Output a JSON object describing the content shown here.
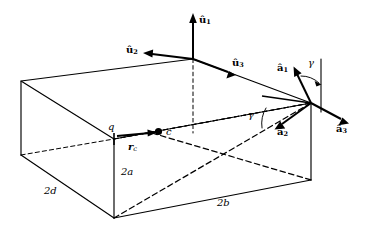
{
  "figure": {
    "background_color": "#ffffff",
    "stroke_color": "#000000"
  },
  "labels": {
    "u1": {
      "symbol": "û",
      "subscript": "1"
    },
    "u2": {
      "symbol": "û",
      "subscript": "2"
    },
    "u3": {
      "symbol": "û",
      "subscript": "3"
    },
    "a1": {
      "symbol": "â",
      "subscript": "1"
    },
    "a2": {
      "symbol": "â",
      "subscript": "2"
    },
    "a3": {
      "symbol": "â",
      "subscript": "3"
    },
    "gamma_upper": "γ",
    "gamma_lower": "γ",
    "corner_q": "q",
    "center_c": "c",
    "r_c": {
      "symbol": "r",
      "subscript": "c"
    }
  },
  "dimensions": {
    "depth": "2d",
    "height": "2a",
    "width": "2b"
  },
  "geometry": {
    "box_vertices": {
      "top_back_left": [
        21,
        81
      ],
      "top_back_right": [
        193,
        59
      ],
      "top_front_right": [
        311,
        103
      ],
      "top_front_left": [
        114,
        139
      ],
      "bottom_back_left": [
        21,
        155
      ],
      "bottom_front_right": [
        311,
        180
      ],
      "bottom_front_left": [
        114,
        218
      ]
    },
    "u_triad_origin": [
      193,
      59
    ],
    "a_triad_origin": [
      311,
      103
    ],
    "center_point": [
      157,
      132
    ],
    "q_point": [
      114,
      139
    ]
  }
}
